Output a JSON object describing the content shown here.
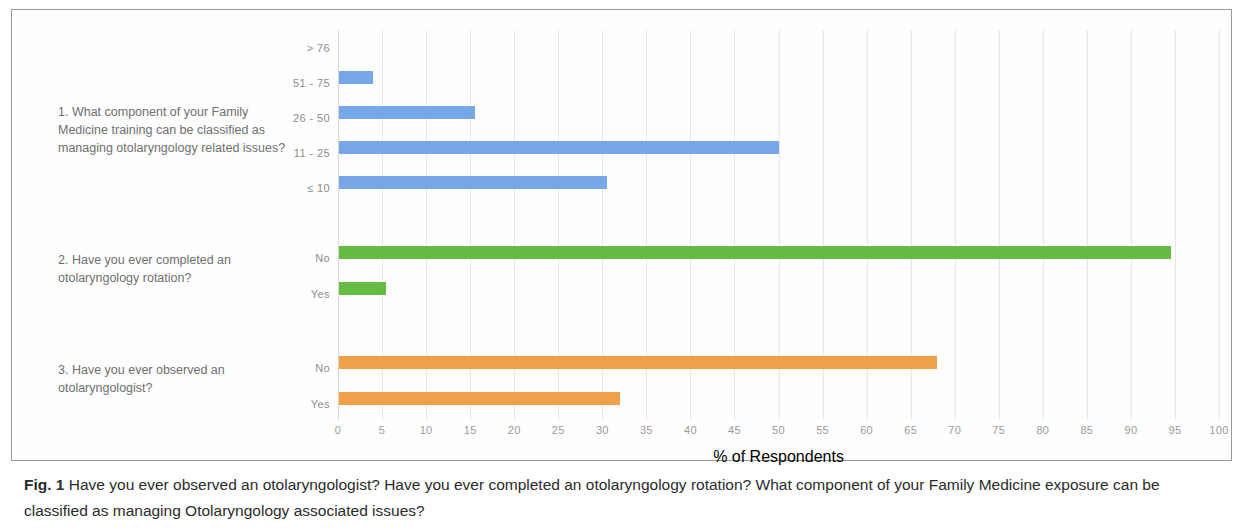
{
  "figure": {
    "label": "Fig. 1",
    "caption": "Have you ever observed an otolaryngologist? Have you ever completed an otolaryngology rotation? What component of your Family Medicine exposure can be classified as managing Otolaryngology associated issues?"
  },
  "questions": [
    {
      "id": "q1",
      "text": "1. What component of your Family Medicine training can be classified as managing otolaryngology related issues?"
    },
    {
      "id": "q2",
      "text": "2. Have you ever completed an otolaryngology rotation?"
    },
    {
      "id": "q3",
      "text": "3. Have you ever observed an otolaryngologist?"
    }
  ],
  "colors": {
    "blue": "#76a7e8",
    "green": "#66bb45",
    "orange": "#f0a049",
    "grid": "#e8e8e8",
    "tick_text": "#9a9a9a",
    "question_text": "#6f6f6f"
  },
  "chart_data": {
    "type": "bar",
    "orientation": "horizontal",
    "title": "",
    "xlabel": "% of Respondents",
    "ylabel": "",
    "xlim": [
      0,
      100
    ],
    "xticks": [
      0,
      5,
      10,
      15,
      20,
      25,
      30,
      35,
      40,
      45,
      50,
      55,
      60,
      65,
      70,
      75,
      80,
      85,
      90,
      95,
      100
    ],
    "grid": true,
    "legend": "none",
    "groups": [
      {
        "question": "1. What component of your Family Medicine training can be classified as managing otolaryngology related issues?",
        "color": "#76a7e8",
        "categories": [
          "> 76",
          "51 - 75",
          "26 - 50",
          "11 - 25",
          "≤ 10"
        ],
        "values": [
          0,
          4,
          15.5,
          50,
          30.5
        ]
      },
      {
        "question": "2. Have you ever completed an otolaryngology rotation?",
        "color": "#66bb45",
        "categories": [
          "No",
          "Yes"
        ],
        "values": [
          94.5,
          5.5
        ]
      },
      {
        "question": "3. Have you ever observed an otolaryngologist?",
        "color": "#f0a049",
        "categories": [
          "No",
          "Yes"
        ],
        "values": [
          68,
          32
        ]
      }
    ]
  }
}
